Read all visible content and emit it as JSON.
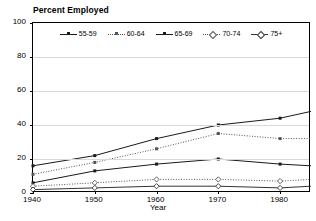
{
  "chart_data": {
    "type": "line",
    "title": "Percent Employed",
    "xlabel": "Year",
    "ylabel": "",
    "xlim": [
      1940,
      1985
    ],
    "ylim": [
      0,
      100
    ],
    "xticks": [
      1940,
      1950,
      1960,
      1970,
      1980
    ],
    "yticks": [
      0,
      20,
      40,
      60,
      80,
      100
    ],
    "xtick_labels": [
      "1940",
      "1950",
      "1960",
      "1970",
      "1980"
    ],
    "ytick_labels": [
      "0",
      "20",
      "40",
      "60",
      "80",
      "100"
    ],
    "grid": true,
    "legend_position": "top-center",
    "x": [
      1940,
      1950,
      1960,
      1970,
      1980,
      1985
    ],
    "series": [
      {
        "name": "55-59",
        "label": "55-59",
        "style": "solid",
        "marker": "square",
        "color": "#1a1a1a",
        "values": [
          16,
          22,
          32,
          40,
          44,
          48
        ]
      },
      {
        "name": "60-64",
        "label": "60-64",
        "style": "dotted",
        "marker": "square",
        "color": "#555555",
        "values": [
          11,
          18,
          26,
          35,
          32,
          32
        ]
      },
      {
        "name": "65-69",
        "label": "65-69",
        "style": "solid",
        "marker": "square",
        "color": "#1a1a1a",
        "values": [
          6,
          13,
          17,
          20,
          17,
          16
        ]
      },
      {
        "name": "70-74",
        "label": "70-74",
        "style": "dotted",
        "marker": "diamond",
        "color": "#555555",
        "values": [
          4,
          6,
          8,
          8,
          7,
          8
        ]
      },
      {
        "name": "75+",
        "label": "75+",
        "style": "solid",
        "marker": "diamond",
        "color": "#333333",
        "values": [
          2,
          3,
          4,
          4,
          3,
          4
        ]
      }
    ]
  }
}
